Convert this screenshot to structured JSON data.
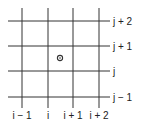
{
  "diagram": {
    "type": "grid-stencil",
    "colors": {
      "line": "#333333",
      "background": "#ffffff"
    },
    "vertical_lines": [
      {
        "x": 22,
        "label": "i − 1"
      },
      {
        "x": 48,
        "label": "i"
      },
      {
        "x": 73,
        "label": "i + 1"
      },
      {
        "x": 99,
        "label": "i + 2"
      }
    ],
    "horizontal_lines": [
      {
        "y": 21,
        "label": "j + 2"
      },
      {
        "y": 46,
        "label": "j + 1"
      },
      {
        "y": 71,
        "label": "j"
      },
      {
        "y": 97,
        "label": "j − 1"
      }
    ],
    "marker": {
      "shape": "circle-dot",
      "cx": 60,
      "cy": 58,
      "r": 2.6
    }
  }
}
